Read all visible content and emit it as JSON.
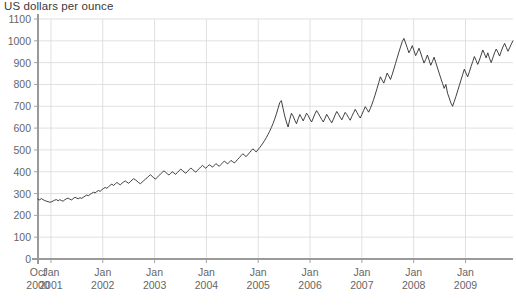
{
  "chart_data": {
    "type": "line",
    "title": "US dollars per ounce",
    "ylabel": "US dollars per ounce",
    "xlabel": "",
    "ylim": [
      0,
      1100
    ],
    "yticks": [
      0,
      100,
      200,
      300,
      400,
      500,
      600,
      700,
      800,
      900,
      1000,
      1100
    ],
    "grid": true,
    "legend": "none",
    "line_color": "#2b2b2b",
    "grid_color": "#d8d8d8",
    "axis_color": "#9a9a9a",
    "xticks": [
      {
        "label_top": "Oct",
        "label_bottom": "2000",
        "x": 0
      },
      {
        "label_top": "Jan",
        "label_bottom": "2001",
        "x": 3
      },
      {
        "label_top": "Jan",
        "label_bottom": "2002",
        "x": 15
      },
      {
        "label_top": "Jan",
        "label_bottom": "2003",
        "x": 27
      },
      {
        "label_top": "Jan",
        "label_bottom": "2004",
        "x": 39
      },
      {
        "label_top": "Jan",
        "label_bottom": "2005",
        "x": 51
      },
      {
        "label_top": "Jan",
        "label_bottom": "2006",
        "x": 63
      },
      {
        "label_top": "Jan",
        "label_bottom": "2007",
        "x": 75
      },
      {
        "label_top": "Jan",
        "label_bottom": "2008",
        "x": 87
      },
      {
        "label_top": "Jan",
        "label_bottom": "2009",
        "x": 99
      }
    ],
    "xlim": [
      0,
      110
    ],
    "x_unit": "months since Oct 2000",
    "series": [
      {
        "name": "Gold price",
        "values": [
          274,
          271,
          277,
          272,
          268,
          265,
          263,
          260,
          262,
          266,
          270,
          272,
          267,
          272,
          268,
          265,
          272,
          276,
          279,
          274,
          271,
          277,
          283,
          279,
          276,
          281,
          278,
          283,
          288,
          293,
          290,
          296,
          301,
          306,
          303,
          309,
          314,
          310,
          317,
          323,
          328,
          324,
          331,
          338,
          343,
          337,
          344,
          351,
          345,
          340,
          347,
          353,
          358,
          352,
          347,
          354,
          362,
          368,
          363,
          357,
          350,
          345,
          352,
          359,
          366,
          372,
          380,
          386,
          379,
          372,
          366,
          374,
          382,
          390,
          397,
          404,
          398,
          391,
          385,
          392,
          400,
          394,
          388,
          396,
          404,
          412,
          406,
          399,
          393,
          401,
          409,
          417,
          411,
          404,
          398,
          406,
          414,
          422,
          429,
          422,
          416,
          424,
          432,
          427,
          421,
          429,
          437,
          431,
          425,
          433,
          441,
          449,
          442,
          436,
          444,
          452,
          446,
          440,
          448,
          457,
          465,
          474,
          482,
          476,
          469,
          478,
          487,
          496,
          505,
          498,
          491,
          500,
          510,
          520,
          531,
          543,
          556,
          570,
          585,
          602,
          620,
          641,
          664,
          690,
          716,
          726,
          690,
          655,
          628,
          605,
          640,
          668,
          655,
          636,
          620,
          643,
          662,
          648,
          633,
          650,
          668,
          657,
          641,
          628,
          646,
          665,
          680,
          668,
          654,
          640,
          628,
          645,
          663,
          650,
          636,
          624,
          641,
          660,
          676,
          664,
          650,
          638,
          655,
          672,
          662,
          648,
          636,
          654,
          670,
          686,
          672,
          658,
          646,
          663,
          681,
          698,
          686,
          673,
          690,
          710,
          732,
          756,
          782,
          808,
          835,
          820,
          806,
          828,
          852,
          838,
          823,
          845,
          870,
          896,
          922,
          948,
          972,
          996,
          1011,
          990,
          968,
          945,
          960,
          978,
          955,
          932,
          948,
          966,
          944,
          920,
          898,
          915,
          935,
          912,
          888,
          905,
          925,
          900,
          876,
          852,
          828,
          805,
          782,
          800,
          760,
          738,
          715,
          700,
          722,
          745,
          770,
          795,
          820,
          845,
          870,
          852,
          835,
          858,
          882,
          905,
          928,
          910,
          892,
          912,
          935,
          958,
          940,
          922,
          945,
          920,
          900,
          922,
          945,
          962,
          948,
          930,
          952,
          972,
          988,
          970,
          952,
          968,
          985,
          1000
        ]
      }
    ]
  }
}
